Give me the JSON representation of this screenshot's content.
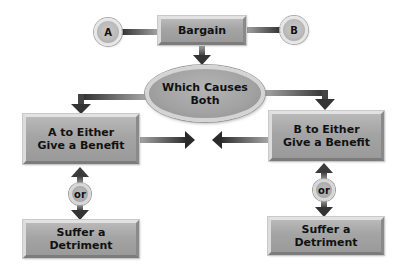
{
  "diagram": {
    "type": "flowchart",
    "parties": {
      "a": "A",
      "b": "B"
    },
    "center_box": "Bargain",
    "ellipse": {
      "line1": "Which Causes",
      "line2": "Both"
    },
    "left_branch": {
      "benefit_line1": "A to Either",
      "benefit_line2": "Give a Benefit",
      "or_label": "or",
      "detriment": "Suffer a Detriment"
    },
    "right_branch": {
      "benefit_line1": "B to Either",
      "benefit_line2": "Give a Benefit",
      "or_label": "or",
      "detriment": "Suffer a Detriment"
    },
    "colors": {
      "box_fill": "#a4a4a4",
      "arrow": "#3a3a3a",
      "background": "#ffffff"
    }
  }
}
